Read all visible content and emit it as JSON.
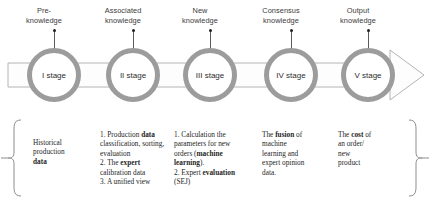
{
  "diagram": {
    "colors": {
      "ring": "#9c9c9c",
      "band_fill": "#fdfdfd",
      "band_stroke": "#b6b6b6",
      "text": "#262626",
      "marker": "#1d1d1d"
    },
    "headers": [
      {
        "line1": "Pre-",
        "line2": "knowledge"
      },
      {
        "line1": "Associated",
        "line2": "knowledge"
      },
      {
        "line1": "New",
        "line2": "knowledge"
      },
      {
        "line1": "Consensus",
        "line2": "knowledge"
      },
      {
        "line1": "Output",
        "line2": "knowledge"
      }
    ],
    "stages": [
      {
        "label": "I stage"
      },
      {
        "label": "II stage"
      },
      {
        "label": "III stage"
      },
      {
        "label": "IV stage"
      },
      {
        "label": "V stage"
      }
    ],
    "notes": [
      {
        "lines": [
          {
            "parts": [
              {
                "text": "Historical",
                "bold": false
              }
            ]
          },
          {
            "parts": [
              {
                "text": "production",
                "bold": false
              }
            ]
          },
          {
            "parts": [
              {
                "text": "data",
                "bold": true
              }
            ]
          }
        ]
      },
      {
        "lines": [
          {
            "parts": [
              {
                "text": "1. Production ",
                "bold": false
              },
              {
                "text": "data",
                "bold": true
              }
            ]
          },
          {
            "parts": [
              {
                "text": "classification, sorting,",
                "bold": false
              }
            ]
          },
          {
            "parts": [
              {
                "text": "evaluation",
                "bold": false
              }
            ]
          },
          {
            "parts": [
              {
                "text": "2. The  ",
                "bold": false
              },
              {
                "text": "expert",
                "bold": true
              }
            ]
          },
          {
            "parts": [
              {
                "text": "calibration data",
                "bold": false
              }
            ]
          },
          {
            "parts": [
              {
                "text": "3. A unified view",
                "bold": false
              }
            ]
          }
        ]
      },
      {
        "lines": [
          {
            "parts": [
              {
                "text": "1. Calculation the",
                "bold": false
              }
            ]
          },
          {
            "parts": [
              {
                "text": "parameters for new",
                "bold": false
              }
            ]
          },
          {
            "parts": [
              {
                "text": "orders (",
                "bold": false
              },
              {
                "text": "machine",
                "bold": true
              }
            ]
          },
          {
            "parts": [
              {
                "text": "learning",
                "bold": true
              },
              {
                "text": ").",
                "bold": false
              }
            ]
          },
          {
            "parts": [
              {
                "text": "2. Expert ",
                "bold": false
              },
              {
                "text": "evaluation",
                "bold": true
              }
            ]
          },
          {
            "parts": [
              {
                "text": "(SEJ)",
                "bold": false
              }
            ]
          }
        ]
      },
      {
        "lines": [
          {
            "parts": [
              {
                "text": "The ",
                "bold": false
              },
              {
                "text": "fusion",
                "bold": true
              },
              {
                "text": " of",
                "bold": false
              }
            ]
          },
          {
            "parts": [
              {
                "text": "machine",
                "bold": false
              }
            ]
          },
          {
            "parts": [
              {
                "text": "learning and",
                "bold": false
              }
            ]
          },
          {
            "parts": [
              {
                "text": "expert opinion",
                "bold": false
              }
            ]
          },
          {
            "parts": [
              {
                "text": "data.",
                "bold": false
              }
            ]
          }
        ]
      },
      {
        "lines": [
          {
            "parts": [
              {
                "text": "The ",
                "bold": false
              },
              {
                "text": "cost",
                "bold": true
              },
              {
                "text": " of",
                "bold": false
              }
            ]
          },
          {
            "parts": [
              {
                "text": "an order/",
                "bold": false
              }
            ]
          },
          {
            "parts": [
              {
                "text": "new",
                "bold": false
              }
            ]
          },
          {
            "parts": [
              {
                "text": "product",
                "bold": false
              }
            ]
          }
        ]
      }
    ]
  }
}
